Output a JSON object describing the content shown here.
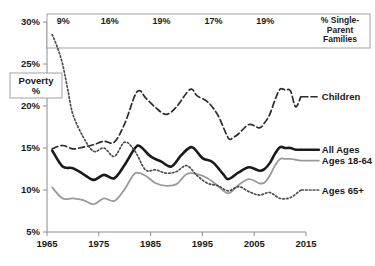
{
  "chart_data": {
    "type": "line",
    "title": "",
    "xlabel": "",
    "ylabel": "Poverty %",
    "xlim": [
      1965,
      2015
    ],
    "ylim": [
      5,
      30
    ],
    "y_tick_labels": [
      "30%",
      "25%",
      "20%",
      "15%",
      "10%",
      "5%"
    ],
    "y_ticks": [
      30,
      25,
      20,
      15,
      10,
      5
    ],
    "x_tick_labels": [
      "1965",
      "1975",
      "1985",
      "1995",
      "2005",
      "2015"
    ],
    "x_ticks": [
      1965,
      1975,
      1985,
      1995,
      2005,
      2015
    ],
    "grid": false,
    "legend_position": "right-inline",
    "y_axis_box_label": "Poverty\n%",
    "y_axis_box_label_line1": "Poverty",
    "y_axis_box_label_line2": "%",
    "annotation_table": {
      "title_line1": "% Single-",
      "title_line2": "Parent",
      "title_line3": "Families",
      "cells": [
        {
          "year": 1966,
          "value": "9%"
        },
        {
          "year": 1975,
          "value": "16%"
        },
        {
          "year": 1985,
          "value": "19%"
        },
        {
          "year": 1995,
          "value": "17%"
        },
        {
          "year": 2005,
          "value": "19%"
        }
      ]
    },
    "series": [
      {
        "name": "Children",
        "label": "Children",
        "color": "#2b2b2b",
        "style": "dashed",
        "width": 1.7,
        "x": [
          1966,
          1968,
          1970,
          1972,
          1974,
          1976,
          1978,
          1980,
          1982,
          1983,
          1984,
          1986,
          1988,
          1990,
          1992,
          1993,
          1994,
          1996,
          1998,
          2000,
          2001,
          2002,
          2004,
          2006,
          2007,
          2008,
          2009,
          2010,
          2011,
          2012,
          2013,
          2014
        ],
        "values": [
          14.9,
          15.3,
          14.9,
          15.1,
          15.4,
          15.8,
          15.7,
          17.9,
          21.3,
          21.8,
          21.0,
          19.8,
          19.0,
          19.9,
          21.6,
          22.0,
          21.2,
          20.5,
          18.9,
          16.2,
          16.3,
          16.7,
          17.8,
          17.4,
          18.0,
          19.0,
          20.7,
          22.0,
          21.9,
          21.8,
          19.9,
          21.1
        ],
        "endpoint_label_at": 2014
      },
      {
        "name": "All Ages",
        "label": "All Ages",
        "color": "#1a1a1a",
        "style": "solid",
        "width": 2.6,
        "x": [
          1966,
          1968,
          1970,
          1972,
          1974,
          1976,
          1978,
          1980,
          1982,
          1983,
          1985,
          1987,
          1989,
          1991,
          1993,
          1995,
          1997,
          1999,
          2000,
          2002,
          2004,
          2006,
          2007,
          2008,
          2009,
          2010,
          2011,
          2012,
          2013,
          2014
        ],
        "values": [
          14.7,
          12.8,
          12.6,
          11.9,
          11.2,
          11.8,
          11.4,
          13.0,
          15.0,
          15.2,
          14.0,
          13.4,
          12.8,
          14.2,
          15.1,
          13.8,
          13.3,
          11.9,
          11.3,
          12.1,
          12.7,
          12.3,
          12.5,
          13.2,
          14.3,
          15.1,
          15.0,
          15.0,
          14.8,
          14.8
        ],
        "endpoint_label_at": 2014
      },
      {
        "name": "Ages 18-64",
        "label": "Ages 18-64",
        "color": "#9a9a9a",
        "style": "solid",
        "width": 1.8,
        "x": [
          1966,
          1968,
          1970,
          1972,
          1974,
          1976,
          1978,
          1980,
          1982,
          1984,
          1986,
          1988,
          1990,
          1992,
          1994,
          1996,
          1998,
          2000,
          2002,
          2004,
          2006,
          2007,
          2008,
          2009,
          2010,
          2011,
          2012,
          2013,
          2014
        ],
        "values": [
          10.3,
          9.0,
          9.0,
          8.8,
          8.3,
          9.0,
          8.7,
          10.1,
          12.0,
          11.7,
          10.8,
          10.5,
          10.7,
          11.9,
          11.9,
          11.4,
          10.5,
          9.6,
          10.6,
          11.3,
          10.8,
          10.9,
          11.7,
          12.9,
          13.7,
          13.7,
          13.7,
          13.6,
          13.5
        ],
        "endpoint_label_at": 2014
      },
      {
        "name": "Ages 65+",
        "label": "Ages 65+",
        "color": "#4d4d4d",
        "style": "dotted",
        "width": 1.7,
        "x": [
          1966,
          1967,
          1968,
          1969,
          1970,
          1972,
          1974,
          1976,
          1978,
          1980,
          1982,
          1984,
          1986,
          1988,
          1990,
          1992,
          1994,
          1996,
          1998,
          2000,
          2002,
          2004,
          2006,
          2008,
          2010,
          2012,
          2014
        ],
        "values": [
          28.5,
          27.0,
          25.0,
          22.0,
          19.0,
          16.3,
          14.6,
          15.0,
          14.0,
          15.7,
          14.6,
          12.4,
          12.4,
          12.0,
          12.2,
          12.9,
          11.7,
          10.8,
          10.5,
          9.9,
          10.4,
          9.8,
          9.4,
          9.7,
          9.0,
          9.1,
          10.0
        ],
        "endpoint_label_at": 2014
      }
    ]
  }
}
